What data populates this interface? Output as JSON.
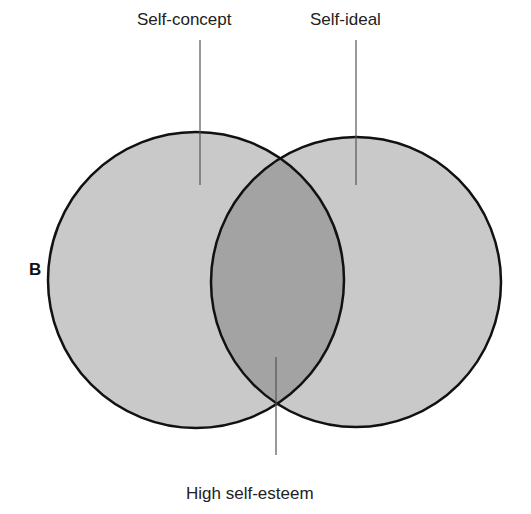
{
  "panel_label": "B",
  "sets": [
    {
      "name": "Self-concept",
      "cx": 196,
      "cy": 280,
      "r": 148
    },
    {
      "name": "Self-ideal",
      "cx": 356,
      "cy": 282,
      "r": 145
    }
  ],
  "intersection": {
    "name": "High self-esteem"
  },
  "colors": {
    "circle_fill": "#c9c9c9",
    "overlap_fill": "#a3a3a3",
    "stroke": "#111111",
    "leader_line": "#555555"
  }
}
